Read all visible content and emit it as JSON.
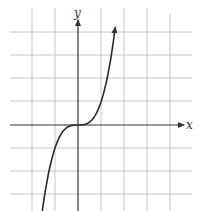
{
  "chart_data": {
    "type": "line",
    "title": "",
    "function": "y = x^3",
    "xlabel": "x",
    "ylabel": "y",
    "xlim": [
      -3,
      5
    ],
    "ylim": [
      -3.7,
      4.1
    ],
    "grid": true,
    "tick_labels": false,
    "series": [
      {
        "name": "y = x^3",
        "x": [
          -1.6,
          -1.4,
          -1.2,
          -1.0,
          -0.8,
          -0.6,
          -0.4,
          -0.2,
          0,
          0.2,
          0.4,
          0.6,
          0.8,
          1.0,
          1.2,
          1.4,
          1.6
        ],
        "y": [
          -4.1,
          -2.74,
          -1.73,
          -1.0,
          -0.51,
          -0.22,
          -0.06,
          -0.01,
          0,
          0.01,
          0.06,
          0.22,
          0.51,
          1.0,
          1.73,
          2.74,
          4.1
        ]
      }
    ],
    "arrows": "both ends of curve and positive axis directions"
  },
  "axes": {
    "x_label": "x",
    "y_label": "y"
  },
  "colors": {
    "grid": "#c8c8c8",
    "axis": "#333333",
    "curve": "#2a2a2a"
  }
}
